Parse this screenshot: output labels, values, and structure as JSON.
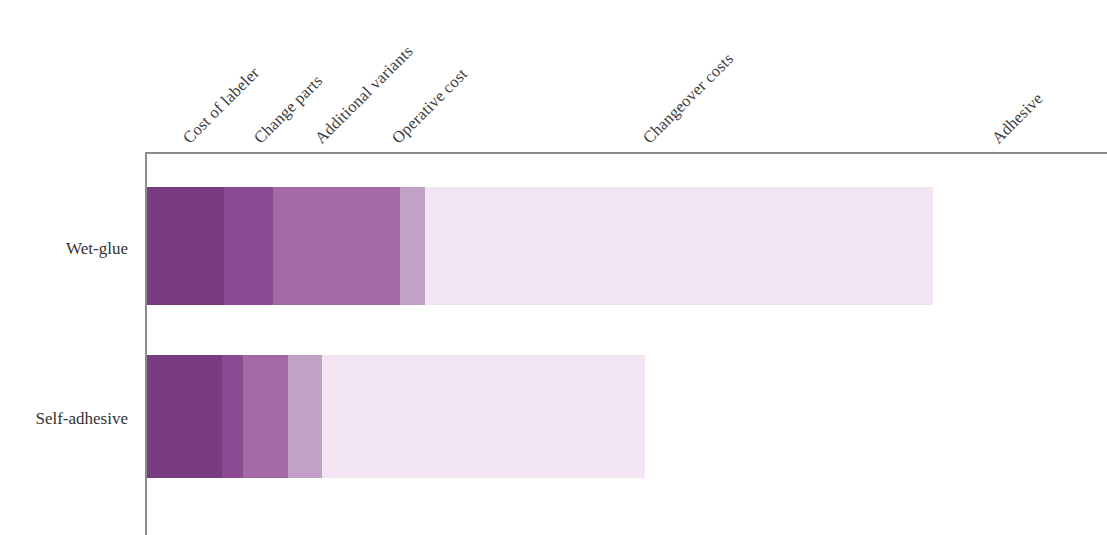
{
  "chart_data": {
    "type": "bar",
    "orientation": "horizontal",
    "stacked": true,
    "title": "",
    "subtitle": "",
    "xlabel": "",
    "ylabel": "",
    "grid": false,
    "legend_position": "top-axis-rotated-labels",
    "categories": [
      "Wet-glue",
      "Self-adhesive"
    ],
    "series": [
      {
        "name": "Cost of labeler",
        "color": "#7b3d83",
        "values": [
          77,
          75
        ]
      },
      {
        "name": "Change parts",
        "color": "#8e4c95",
        "values": [
          49,
          21
        ]
      },
      {
        "name": "Additional variants",
        "color": "#a56ca9",
        "values": [
          127,
          45
        ]
      },
      {
        "name": "Operative cost",
        "color": "#c5a4ca",
        "values": [
          25,
          34
        ]
      },
      {
        "name": "Changeover costs",
        "color": "#f7e9f7",
        "values": [
          508,
          323
        ]
      },
      {
        "name": "Adhesive",
        "color": "#f7e9f7",
        "values": [
          0,
          0
        ]
      }
    ],
    "totals": [
      786,
      498
    ],
    "units": "relative cost (unlabeled axis)"
  },
  "axis": {
    "category_labels": [
      {
        "text": "Cost of labeler",
        "x": 186,
        "y": 131
      },
      {
        "text": "Change parts",
        "x": 257,
        "y": 131
      },
      {
        "text": "Additional variants",
        "x": 318,
        "y": 131
      },
      {
        "text": "Operative cost",
        "x": 395,
        "y": 131
      },
      {
        "text": "Changeover costs",
        "x": 646,
        "y": 131
      },
      {
        "text": "Adhesive",
        "x": 995,
        "y": 131
      }
    ]
  },
  "rows": [
    {
      "label": "Wet-glue",
      "label_top": 239,
      "bar_top": 187,
      "bar_height": 118,
      "segments": [
        {
          "name": "Cost of labeler",
          "width": 77,
          "color": "#7b3d83"
        },
        {
          "name": "Change parts",
          "width": 49,
          "color": "#8e4c95"
        },
        {
          "name": "Additional variants",
          "width": 127,
          "color": "#a56ca9"
        },
        {
          "name": "Operative cost",
          "width": 25,
          "color": "#c5a4ca"
        },
        {
          "name": "Changeover costs",
          "width": 508,
          "color": "#f7e9f7"
        }
      ]
    },
    {
      "label": "Self-adhesive",
      "label_top": 409,
      "bar_top": 355,
      "bar_height": 123,
      "segments": [
        {
          "name": "Cost of labeler",
          "width": 75,
          "color": "#7b3d83"
        },
        {
          "name": "Change parts",
          "width": 21,
          "color": "#8e4c95"
        },
        {
          "name": "Additional variants",
          "width": 45,
          "color": "#a56ca9"
        },
        {
          "name": "Operative cost",
          "width": 34,
          "color": "#c5a4ca"
        },
        {
          "name": "Changeover costs",
          "width": 323,
          "color": "#f7e9f7"
        }
      ]
    }
  ],
  "geometry": {
    "plot_left": 147,
    "axis_color": "#8c8c8c"
  }
}
